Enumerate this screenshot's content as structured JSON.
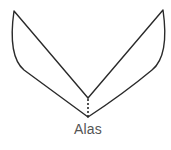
{
  "diagram": {
    "caption": "Alas",
    "stroke_color": "#2a2a2a",
    "caption_color": "#555555",
    "shapes": [
      {
        "name": "left-wing",
        "tip": [
          14,
          11
        ],
        "inner_vertex": [
          88,
          98
        ],
        "bottom_vertex": [
          88,
          117
        ]
      },
      {
        "name": "right-wing",
        "tip": [
          163,
          10
        ],
        "inner_vertex": [
          88,
          98
        ],
        "bottom_vertex": [
          88,
          117
        ]
      },
      {
        "name": "center-dotted-line",
        "from": [
          88,
          98
        ],
        "to": [
          88,
          117
        ],
        "style": "dotted"
      }
    ]
  }
}
